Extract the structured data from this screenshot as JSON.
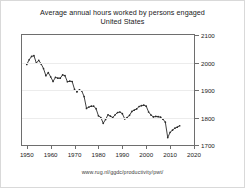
{
  "chart_title_line1": "Average annual hours worked by persons engaged",
  "chart_title_line2": "United States",
  "footer_source": "www.rug.nl/ggdc/productivity/pwt/",
  "colors": {
    "line": "#2b2b2b",
    "axis": "#6e6e6e",
    "grid": "#ececec",
    "frame": "#d9d9d9",
    "background": "#ffffff",
    "text": "#1a1a1a"
  },
  "chart_data": {
    "type": "line",
    "title": "Average annual hours worked by persons engaged United States",
    "subtitle": "United States",
    "xlabel": "",
    "ylabel": "",
    "xlim": [
      1948,
      2020
    ],
    "ylim": [
      1700,
      2100
    ],
    "grid": true,
    "legend": false,
    "y_axis_position": "right",
    "yticks": [
      1700,
      1800,
      1900,
      2000,
      2100
    ],
    "xticks": [
      1950,
      1960,
      1970,
      1980,
      1990,
      2000,
      2010,
      2020
    ],
    "xtick_labels": [
      "1950",
      "1960",
      "1970",
      "1980",
      "1990",
      "2000",
      "2010",
      "2020"
    ],
    "ytick_labels": [
      "1700",
      "1800",
      "1900",
      "2000",
      "2100"
    ],
    "series": [
      {
        "name": "Average annual hours worked per person engaged",
        "marker": "dot",
        "x": [
          1950,
          1951,
          1952,
          1953,
          1954,
          1955,
          1956,
          1957,
          1958,
          1959,
          1960,
          1961,
          1962,
          1963,
          1964,
          1965,
          1966,
          1967,
          1968,
          1969,
          1970,
          1971,
          1972,
          1973,
          1974,
          1975,
          1976,
          1977,
          1978,
          1979,
          1980,
          1981,
          1982,
          1983,
          1984,
          1985,
          1986,
          1987,
          1988,
          1989,
          1990,
          1991,
          1992,
          1993,
          1994,
          1995,
          1996,
          1997,
          1998,
          1999,
          2000,
          2001,
          2002,
          2003,
          2004,
          2005,
          2006,
          2007,
          2008,
          2009,
          2010,
          2011,
          2012,
          2013,
          2014
        ],
        "values": [
          1993,
          2010,
          2022,
          2025,
          1998,
          2008,
          1995,
          1978,
          1952,
          1963,
          1948,
          1931,
          1946,
          1943,
          1943,
          1955,
          1952,
          1930,
          1932,
          1931,
          1902,
          1893,
          1901,
          1897,
          1876,
          1833,
          1838,
          1841,
          1841,
          1832,
          1806,
          1800,
          1779,
          1793,
          1810,
          1805,
          1800,
          1810,
          1818,
          1820,
          1814,
          1795,
          1800,
          1808,
          1822,
          1827,
          1831,
          1840,
          1843,
          1845,
          1841,
          1820,
          1809,
          1802,
          1804,
          1803,
          1801,
          1794,
          1783,
          1727,
          1746,
          1754,
          1761,
          1765,
          1770
        ]
      }
    ]
  }
}
